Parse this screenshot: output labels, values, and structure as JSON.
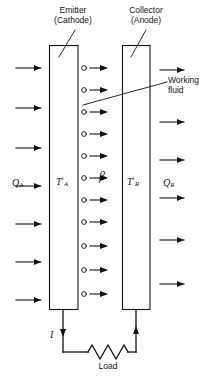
{
  "figure": {
    "type": "diagram",
    "labels": {
      "emitter_line1": "Emitter",
      "emitter_line2": "(Cathode)",
      "collector_line1": "Collector",
      "collector_line2": "(Anode)",
      "working_fluid_line1": "Working",
      "working_fluid_line2": "fluid",
      "load": "Load",
      "current_symbol": "I",
      "beta_symbol": "β"
    },
    "quantities": [
      {
        "name": "heat-input",
        "base": "Q",
        "sub": "A",
        "sup": "",
        "x": 12,
        "y": 178
      },
      {
        "name": "emitter-temp",
        "base": "T",
        "sub": "A",
        "sup": "°",
        "x": 56,
        "y": 176
      },
      {
        "name": "collector-temp",
        "base": "T",
        "sub": "R",
        "sup": "°",
        "x": 127,
        "y": 176
      },
      {
        "name": "heat-rejected",
        "base": "Q",
        "sub": "R",
        "sup": "",
        "x": 163,
        "y": 178
      }
    ],
    "electrodes": {
      "emitter": {
        "x": 49,
        "y": 45,
        "w": 29,
        "h": 265
      },
      "collector": {
        "x": 122,
        "y": 45,
        "w": 28,
        "h": 265
      }
    },
    "electron_rows_y": [
      68,
      90,
      112,
      134,
      156,
      178,
      200,
      222,
      246,
      270,
      294
    ],
    "heat_in_arrows_y": [
      68,
      108,
      148,
      186,
      224,
      262,
      300
    ],
    "heat_out_arrows_y": [
      70,
      122,
      160,
      198,
      240,
      284
    ],
    "colors": {
      "stroke": "#111111",
      "background": "#ffffff",
      "text": "#111111"
    }
  }
}
